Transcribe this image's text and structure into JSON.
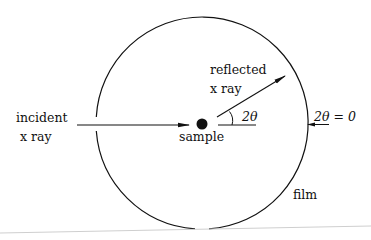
{
  "diagram": {
    "labels": {
      "incident_line1": "incident",
      "incident_line2": "x ray",
      "reflected_line1": "reflected",
      "reflected_line2": "x ray",
      "sample": "sample",
      "angle": "2θ",
      "zero_angle": "2θ = 0",
      "film": "film"
    },
    "colors": {
      "stroke": "#111111",
      "background": "#ffffff",
      "page_edge": "#c8c8c8"
    }
  }
}
